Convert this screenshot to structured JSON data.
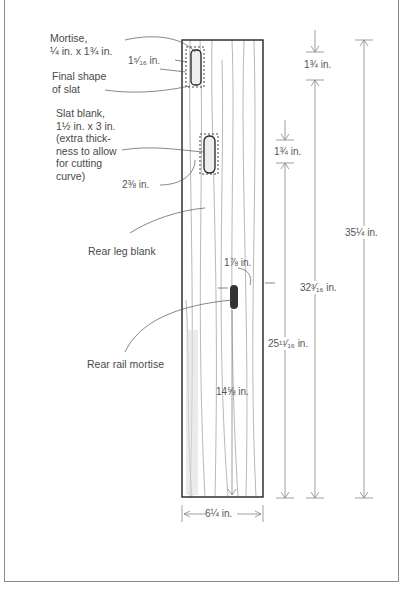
{
  "figure": {
    "type": "technical drawing",
    "subject": "Rear leg blank"
  },
  "labels": {
    "mortise": [
      "Mortise,",
      "¼ in. x 1¾ in."
    ],
    "final_shape": [
      "Final shape",
      "of slat"
    ],
    "slat_blank": [
      "Slat blank,",
      "1½ in. x 3 in.",
      "(extra thick-",
      "ness to allow",
      "for cutting",
      "curve)"
    ],
    "rear_leg_blank": "Rear leg blank",
    "rear_rail_mortise": "Rear rail mortise"
  },
  "dimensions": {
    "top_mortise_offset": "1⁵⁄₁₆ in.",
    "slat_offset": "2⅜ in.",
    "rail_mortise_offset": "1⅞ in.",
    "top_to_first_mortise": "1¾ in.",
    "second_gap": "1¾ in.",
    "overall_length": "35¼ in.",
    "to_first_mortise": "32³⁄₁₆ in.",
    "to_second_mortise": "25¹¹⁄₁₆ in.",
    "rail_mortise_height": "14⅝ in.",
    "width": "6¼ in."
  },
  "colors": {
    "line": "#555555",
    "board_outline": "#222222",
    "grain": "#8a8a8a"
  }
}
